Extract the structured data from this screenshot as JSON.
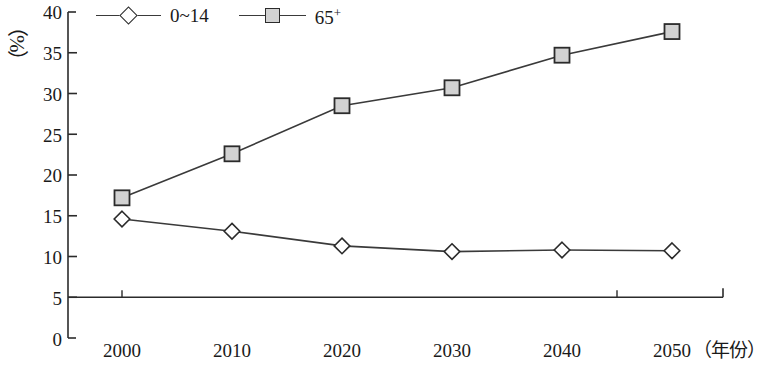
{
  "chart_data": {
    "type": "line",
    "title": "",
    "subtitle": "",
    "xlabel": "（年份）",
    "ylabel": "（%）",
    "categories": [
      "2000",
      "2010",
      "2020",
      "2030",
      "2040",
      "2050"
    ],
    "x": [
      2000,
      2010,
      2020,
      2030,
      2040,
      2050
    ],
    "series": [
      {
        "name": "0~14",
        "marker": "diamond",
        "values": [
          14.6,
          13.1,
          11.3,
          10.6,
          10.8,
          10.7
        ]
      },
      {
        "name": "65+",
        "marker": "square",
        "values": [
          17.2,
          22.6,
          28.5,
          30.7,
          34.7,
          37.6
        ]
      }
    ],
    "ylim": [
      0,
      40
    ],
    "yticks": [
      "0",
      "5",
      "10",
      "15",
      "20",
      "25",
      "30",
      "35",
      "40"
    ],
    "ytick_values": [
      0,
      5,
      10,
      15,
      20,
      25,
      30,
      35,
      40
    ],
    "grid": false,
    "legend_position": "top-left",
    "baseline_value": 5,
    "colors": {
      "line": "#3a3a3a",
      "axis": "#2b2b2b",
      "diamond_fill": "#ffffff",
      "square_fill": "#d2d2d2",
      "marker_stroke": "#2b2b2b",
      "background": "#ffffff"
    }
  },
  "legend": {
    "entries": [
      {
        "label": "0~14",
        "label_base": "0~14",
        "label_sup": ""
      },
      {
        "label": "65+",
        "label_base": "65",
        "label_sup": "+"
      }
    ]
  },
  "axes": {
    "y_unit": "（%）",
    "x_title": "（年份）"
  }
}
